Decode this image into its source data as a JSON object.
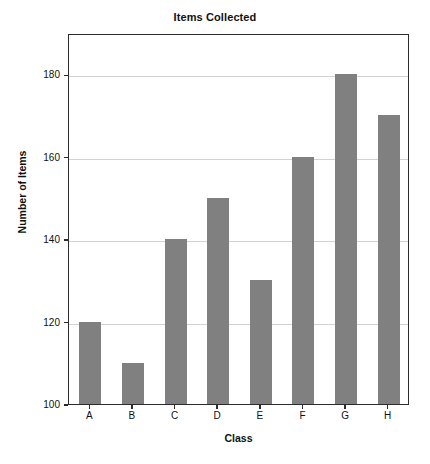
{
  "chart_data": {
    "type": "bar",
    "title": "Items Collected",
    "xlabel": "Class",
    "ylabel": "Number of Items",
    "categories": [
      "A",
      "B",
      "C",
      "D",
      "E",
      "F",
      "G",
      "H"
    ],
    "values": [
      120,
      110,
      140,
      150,
      130,
      160,
      180,
      170
    ],
    "ylim": [
      100,
      190
    ],
    "yticks": [
      100,
      120,
      140,
      160,
      180
    ],
    "ytick_labels": [
      "100",
      "120",
      "140",
      "160",
      "180"
    ],
    "grid": true,
    "grid_axis": "y",
    "legend": false,
    "bar_color": "#808080",
    "gridline_color": "#d2d2d2",
    "frame_color": "#2b2b2b",
    "background": "#ffffff"
  }
}
